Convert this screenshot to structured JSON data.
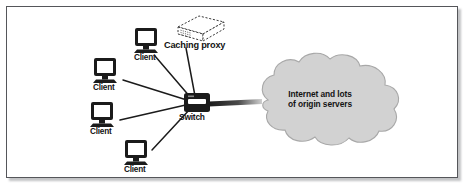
{
  "figure": {
    "border_color": "#55565a",
    "background_color": "#ffffff"
  },
  "colors": {
    "ink": "#141414",
    "device_fill": "#1b1b1b",
    "screen_fill": "#ffffff",
    "cloud_fill": "#d2d2d2",
    "cloud_stroke": "#a8a8a8",
    "link_stroke": "#1b1b1b",
    "dashed_stroke": "#3a3a3a"
  },
  "nodes": {
    "clients": [
      {
        "id": "client-top",
        "label": "Client",
        "x": 148,
        "y": 40,
        "label_x": 136,
        "label_y": 57
      },
      {
        "id": "client-upper-left",
        "label": "Client",
        "x": 107,
        "y": 70,
        "label_x": 95,
        "label_y": 87
      },
      {
        "id": "client-lower-left",
        "label": "Client",
        "x": 104,
        "y": 114,
        "label_x": 92,
        "label_y": 131
      },
      {
        "id": "client-bottom",
        "label": "Client",
        "x": 138,
        "y": 152,
        "label_x": 126,
        "label_y": 169
      }
    ],
    "proxy": {
      "id": "caching-proxy",
      "label": "Caching proxy",
      "x": 190,
      "y": 26,
      "label_x": 164,
      "label_y": 48
    },
    "switch": {
      "id": "switch",
      "label": "Switch",
      "x": 196,
      "y": 102,
      "label_x": 180,
      "label_y": 116
    },
    "cloud": {
      "id": "internet-cloud",
      "label_line1": "Internet and lots",
      "label_line2": "of origin servers",
      "cx": 320,
      "cy": 100
    }
  },
  "links": [
    {
      "from": "client-top",
      "to": "switch"
    },
    {
      "from": "client-upper-left",
      "to": "switch"
    },
    {
      "from": "client-lower-left",
      "to": "switch"
    },
    {
      "from": "client-bottom",
      "to": "switch"
    },
    {
      "from": "caching-proxy",
      "to": "switch"
    },
    {
      "from": "switch",
      "to": "internet-cloud"
    }
  ]
}
